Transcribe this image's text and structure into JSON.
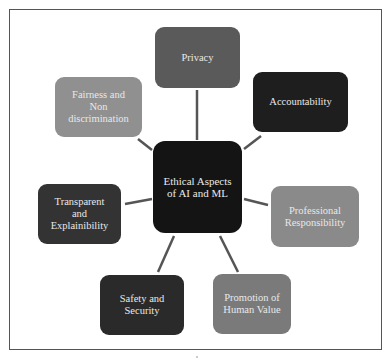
{
  "diagram": {
    "type": "hub-and-spoke",
    "center": {
      "label": "Ethical Aspects of AI and ML",
      "lines": [
        "Ethical Aspects",
        "of AI and ML"
      ],
      "color": "#141414"
    },
    "nodes": [
      {
        "id": "privacy",
        "label": "Privacy",
        "lines": [
          "Privacy"
        ],
        "color": "#5a5a5a"
      },
      {
        "id": "accountability",
        "label": "Accountability",
        "lines": [
          "Accountability"
        ],
        "color": "#1e1e1e"
      },
      {
        "id": "professional",
        "label": "Professional Responsibility",
        "lines": [
          "Professional",
          "Responsibility"
        ],
        "color": "#8a8a8a"
      },
      {
        "id": "promotion",
        "label": "Promotion of Human Value",
        "lines": [
          "Promotion of",
          "Human Value"
        ],
        "color": "#7a7a7a"
      },
      {
        "id": "safety",
        "label": "Safety and Security",
        "lines": [
          "Safety and",
          "Security"
        ],
        "color": "#2a2a2a"
      },
      {
        "id": "transparent",
        "label": "Transparent and Explainibility",
        "lines": [
          "Transparent",
          "and",
          "Explainibility"
        ],
        "color": "#333333"
      },
      {
        "id": "fairness",
        "label": "Fairness and Non discrimination",
        "lines": [
          "Fairness and",
          "Non",
          "discrimination"
        ],
        "color": "#909090"
      }
    ],
    "edge_color": "#555555"
  }
}
